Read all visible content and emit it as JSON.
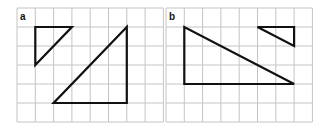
{
  "panels": [
    {
      "label": "a",
      "grid": {
        "x0": 17,
        "y0": 8,
        "cols": 8,
        "rows": 6,
        "cell_w": 18.3,
        "cell_h": 19
      },
      "triangles": [
        {
          "name": "small-triangle",
          "vertices_grid": [
            [
              1,
              1
            ],
            [
              3,
              1
            ],
            [
              1,
              3
            ]
          ]
        },
        {
          "name": "large-triangle",
          "vertices_grid": [
            [
              6,
              1
            ],
            [
              6,
              5
            ],
            [
              2,
              5
            ]
          ]
        }
      ]
    },
    {
      "label": "b",
      "grid": {
        "x0": 166,
        "y0": 8,
        "cols": 8,
        "rows": 6,
        "cell_w": 18.3,
        "cell_h": 19
      },
      "triangles": [
        {
          "name": "large-triangle",
          "vertices_grid": [
            [
              1,
              1
            ],
            [
              1,
              4
            ],
            [
              7,
              4
            ]
          ]
        },
        {
          "name": "small-triangle",
          "vertices_grid": [
            [
              5,
              1
            ],
            [
              7,
              1
            ],
            [
              7,
              2
            ]
          ]
        }
      ]
    }
  ],
  "colors": {
    "grid": "#c4c4c4",
    "shape": "#111111",
    "background": "#ffffff"
  }
}
